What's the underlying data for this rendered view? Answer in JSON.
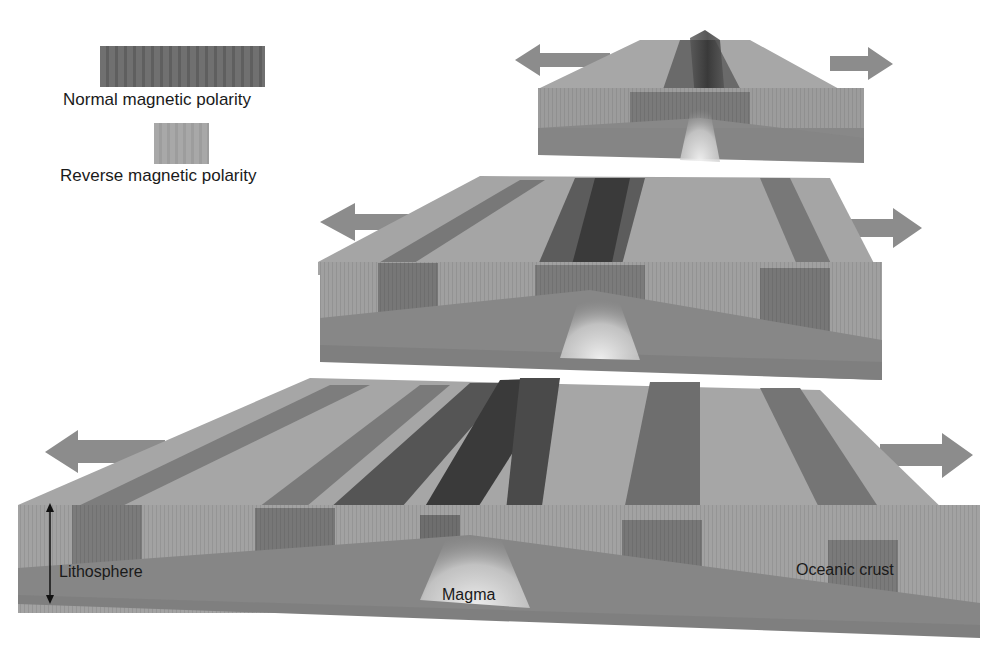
{
  "diagram": {
    "stages": 3
  },
  "legend": {
    "items": [
      {
        "label": "Normal magnetic polarity",
        "color": "#6e6e6e"
      },
      {
        "label": "Reverse magnetic polarity",
        "color": "#a4a4a4"
      }
    ]
  },
  "labels": {
    "lithosphere": "Lithosphere",
    "magma": "Magma",
    "oceanic_crust": "Oceanic crust"
  },
  "colors": {
    "normal": "#6e6e6e",
    "reverse": "#a5a5a5",
    "mantle": "#858585",
    "arrow": "#8a8a8a",
    "magma": "#e2e2e2"
  }
}
